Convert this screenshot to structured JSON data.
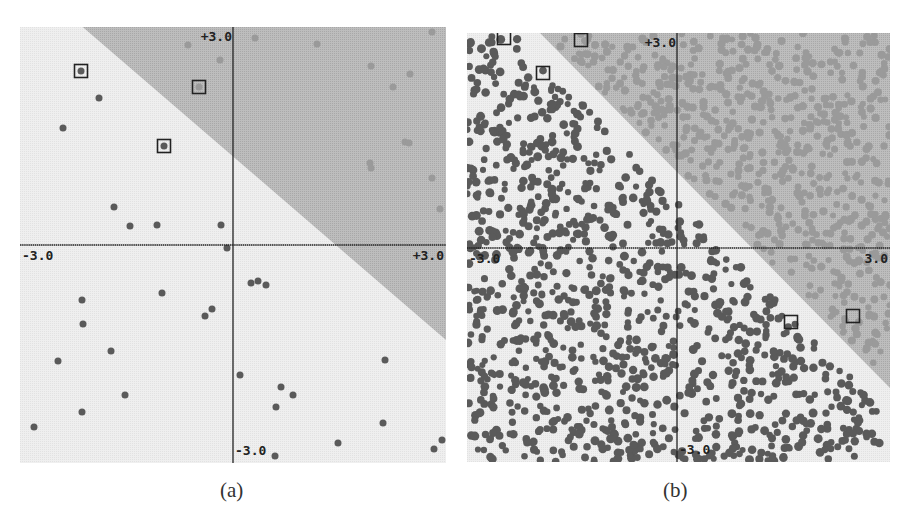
{
  "figure": {
    "captions": [
      "(a)",
      "(b)"
    ]
  },
  "colors": {
    "region_light": "#efefef",
    "region_dark": "#bdbdbd",
    "dot_dark": "#5a5a5a",
    "dot_light": "#9a9a9a",
    "axis": "#222222",
    "box": "#222222"
  },
  "chart_data": [
    {
      "type": "scatter",
      "title": "(a)",
      "xlim": [
        -3.0,
        3.0
      ],
      "ylim": [
        -3.0,
        3.0
      ],
      "tick_labels": {
        "x_min": "-3.0",
        "x_max": "+3.0",
        "y_max": "+3.0",
        "y_min": "-3.0"
      },
      "decision_boundary": {
        "description": "diagonal line separating light (lower-left) region from shaded (upper-right) region",
        "pixel_start": [
          85,
          29
        ],
        "pixel_end": [
          446,
          340
        ]
      },
      "panel_px": {
        "left": 20,
        "top": 27,
        "width": 426,
        "height": 436,
        "origin": [
          233,
          245
        ]
      },
      "boxed_points_px": [
        [
          81,
          71
        ],
        [
          199,
          87
        ],
        [
          164,
          146
        ]
      ],
      "series": [
        {
          "name": "class-dark (light region)",
          "points_px": [
            [
              99,
              98
            ],
            [
              63,
              128
            ],
            [
              114,
              207
            ],
            [
              130,
              226
            ],
            [
              157,
              225
            ],
            [
              221,
              225
            ],
            [
              227,
              248
            ],
            [
              82,
              300
            ],
            [
              83,
              324
            ],
            [
              162,
              293
            ],
            [
              111,
              351
            ],
            [
              58,
              361
            ],
            [
              125,
              395
            ],
            [
              82,
              412
            ],
            [
              34,
              427
            ],
            [
              205,
              316
            ],
            [
              212,
              309
            ],
            [
              251,
              283
            ],
            [
              258,
              281
            ],
            [
              266,
              285
            ],
            [
              240,
              375
            ],
            [
              281,
              387
            ],
            [
              293,
              395
            ],
            [
              276,
              407
            ],
            [
              385,
              360
            ],
            [
              383,
              423
            ],
            [
              338,
              443
            ],
            [
              275,
              456
            ],
            [
              434,
              449
            ],
            [
              442,
              440
            ],
            [
              81,
              71
            ],
            [
              164,
              146
            ]
          ]
        },
        {
          "name": "class-light (shaded region)",
          "points_px": [
            [
              188,
              45
            ],
            [
              220,
              60
            ],
            [
              255,
              38
            ],
            [
              317,
              44
            ],
            [
              432,
              32
            ],
            [
              371,
              66
            ],
            [
              410,
              74
            ],
            [
              393,
              87
            ],
            [
              405,
              142
            ],
            [
              409,
              143
            ],
            [
              370,
              163
            ],
            [
              371,
              168
            ],
            [
              432,
              178
            ],
            [
              440,
              209
            ],
            [
              199,
              87
            ]
          ]
        }
      ]
    },
    {
      "type": "scatter",
      "title": "(b)",
      "xlim": [
        -3.0,
        3.0
      ],
      "ylim": [
        -3.0,
        3.0
      ],
      "tick_labels": {
        "x_min": "-3.0",
        "x_max": "3.0",
        "y_max": "+3.0",
        "y_min": "-3.0"
      },
      "decision_boundary": {
        "description": "diagonal line separating light region (dense dark dots) from shaded region (dense light dots)",
        "pixel_start": [
          540,
          33
        ],
        "pixel_end": [
          890,
          388
        ]
      },
      "panel_px": {
        "left": 467,
        "top": 33,
        "width": 423,
        "height": 429,
        "origin": [
          677,
          248
        ]
      },
      "boxed_points_px": [
        [
          504,
          38
        ],
        [
          581,
          40
        ],
        [
          543,
          73
        ],
        [
          791,
          322
        ],
        [
          853,
          316
        ]
      ],
      "series": [
        {
          "name": "class-dark (light region)",
          "approx_count": 1100,
          "margin_px": 20
        },
        {
          "name": "class-light (shaded region)",
          "approx_count": 650,
          "margin_px": 6
        }
      ]
    }
  ]
}
